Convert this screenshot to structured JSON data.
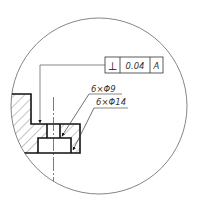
{
  "drawing": {
    "type": "detail-view",
    "feature_control_frame": {
      "symbol": "⊥",
      "symbol_name": "perpendicularity",
      "tolerance": "0.04",
      "datum": "A"
    },
    "annotations": [
      {
        "id": "thru-hole",
        "text": "6×Φ9"
      },
      {
        "id": "counterbore",
        "text": "6×Φ14"
      }
    ],
    "colors": {
      "line": "#111111",
      "thin_line": "#555555",
      "text": "#333333",
      "background": "#ffffff"
    }
  }
}
